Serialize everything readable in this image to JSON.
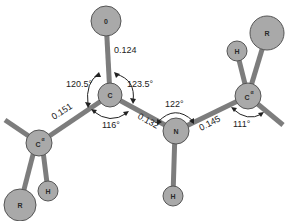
{
  "atoms": {
    "O": {
      "label": "0"
    },
    "C": {
      "label": "C"
    },
    "N": {
      "label": "N"
    },
    "Ca_left": {
      "label": "C",
      "superscript": "α"
    },
    "Ca_right": {
      "label": "C",
      "superscript": "α"
    },
    "H_N": {
      "label": "H"
    },
    "H_left": {
      "label": "H"
    },
    "R_left": {
      "label": "R"
    },
    "H_right": {
      "label": "H"
    },
    "R_right": {
      "label": "R"
    }
  },
  "bond_lengths": {
    "C_O": "0.124",
    "Ca_C": "0.151",
    "C_N": "0.132",
    "N_Ca": "0.145"
  },
  "bond_angles": {
    "O_C_Ca": "120.5°",
    "O_C_N": "123.5°",
    "Ca_C_N": "116°",
    "C_N_Ca": "122°",
    "N_Ca_C": "111°"
  },
  "colors": {
    "atom_fill": "#a9a9a9",
    "bond": "#7d7d7d",
    "text": "#222222"
  }
}
